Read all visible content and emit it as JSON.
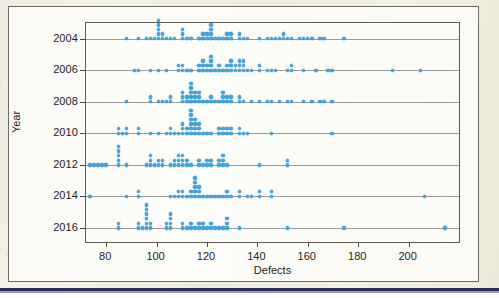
{
  "figure": {
    "background_color": "#f2efe2",
    "panel_color": "#fbfaf4",
    "frame_color": "#6d6a60",
    "rule_color": "#2a2b62"
  },
  "chart_data": {
    "type": "scatter",
    "title": "",
    "subtitle": "",
    "xlabel": "Defects",
    "ylabel": "Year",
    "xlim": [
      72,
      220
    ],
    "ylim": [
      2003.0,
      2016.9
    ],
    "y_inverted": true,
    "grid": "horizontal",
    "legend": "none",
    "marker_color": "#41a3dc",
    "marker_shape": "circle",
    "xticks": [
      80,
      100,
      120,
      140,
      160,
      180,
      200
    ],
    "xtick_labels": [
      "80",
      "100",
      "120",
      "140",
      "160",
      "180",
      "200"
    ],
    "yticks": [
      2004,
      2006,
      2008,
      2010,
      2012,
      2014,
      2016
    ],
    "ytick_labels": [
      "2004",
      "2006",
      "2008",
      "2010",
      "2012",
      "2014",
      "2016"
    ],
    "note": "Stacked dotplot-style scatter: for each year row, repeated defect counts are stacked upward from the year's baseline gridline.",
    "series": [
      {
        "name": "2004",
        "year": 2004,
        "values": [
          88,
          92,
          96,
          98,
          99,
          100,
          100,
          100,
          101,
          101,
          102,
          103,
          104,
          106,
          107,
          110,
          110,
          110,
          112,
          114,
          116,
          118,
          119,
          120,
          120,
          121,
          121,
          122,
          122,
          123,
          124,
          126,
          128,
          128,
          129,
          130,
          132,
          133,
          134,
          136,
          140,
          144,
          146,
          147,
          148,
          150,
          151,
          152,
          154,
          156,
          158,
          160,
          162,
          164,
          166,
          174
        ]
      },
      {
        "name": "2006",
        "year": 2006,
        "values": [
          91,
          92,
          98,
          101,
          104,
          108,
          109,
          110,
          110,
          112,
          114,
          116,
          117,
          118,
          119,
          119,
          120,
          120,
          121,
          121,
          122,
          122,
          123,
          124,
          125,
          126,
          128,
          128,
          129,
          130,
          130,
          131,
          131,
          132,
          132,
          133,
          134,
          134,
          135,
          136,
          138,
          140,
          141,
          144,
          146,
          147,
          152,
          153,
          154,
          158,
          163,
          168,
          169,
          193,
          205
        ]
      },
      {
        "name": "2008",
        "year": 2008,
        "values": [
          88,
          97,
          98,
          101,
          103,
          104,
          105,
          106,
          110,
          110,
          111,
          112,
          112,
          113,
          113,
          114,
          114,
          114,
          115,
          115,
          115,
          116,
          116,
          117,
          118,
          120,
          121,
          122,
          123,
          124,
          126,
          126,
          127,
          128,
          128,
          129,
          130,
          132,
          133,
          134,
          137,
          141,
          144,
          146,
          148,
          152,
          153,
          158,
          161,
          164,
          166,
          169
        ]
      },
      {
        "name": "2010",
        "year": 2010,
        "values": [
          84,
          85,
          86,
          88,
          88,
          92,
          93,
          98,
          101,
          104,
          105,
          106,
          107,
          108,
          110,
          110,
          111,
          112,
          112,
          113,
          113,
          114,
          114,
          114,
          114,
          115,
          115,
          115,
          115,
          116,
          116,
          117,
          118,
          120,
          122,
          124,
          125,
          126,
          127,
          128,
          128,
          129,
          130,
          132,
          133,
          134,
          136,
          145,
          170
        ]
      },
      {
        "name": "2012",
        "year": 2012,
        "values": [
          74,
          75,
          76,
          78,
          80,
          84,
          84,
          84,
          85,
          85,
          88,
          96,
          97,
          98,
          98,
          99,
          100,
          101,
          102,
          103,
          106,
          107,
          107,
          108,
          108,
          109,
          110,
          110,
          111,
          112,
          112,
          113,
          116,
          117,
          118,
          120,
          120,
          121,
          122,
          124,
          125,
          126,
          126,
          127,
          128,
          140,
          152,
          152
        ]
      },
      {
        "name": "2014",
        "year": 2014,
        "values": [
          74,
          88,
          92,
          93,
          106,
          107,
          108,
          109,
          110,
          111,
          112,
          113,
          114,
          115,
          115,
          115,
          115,
          115,
          116,
          116,
          117,
          118,
          120,
          122,
          123,
          124,
          126,
          128,
          128,
          129,
          132,
          133,
          136,
          137,
          140,
          141,
          145,
          146,
          206
        ]
      },
      {
        "name": "2016",
        "year": 2016,
        "values": [
          85,
          85,
          92,
          93,
          94,
          96,
          96,
          96,
          96,
          96,
          96,
          97,
          98,
          104,
          104,
          105,
          105,
          105,
          106,
          110,
          111,
          112,
          113,
          114,
          115,
          116,
          117,
          118,
          119,
          120,
          121,
          122,
          123,
          124,
          126,
          128,
          128,
          128,
          132,
          152,
          174,
          215
        ]
      }
    ]
  }
}
